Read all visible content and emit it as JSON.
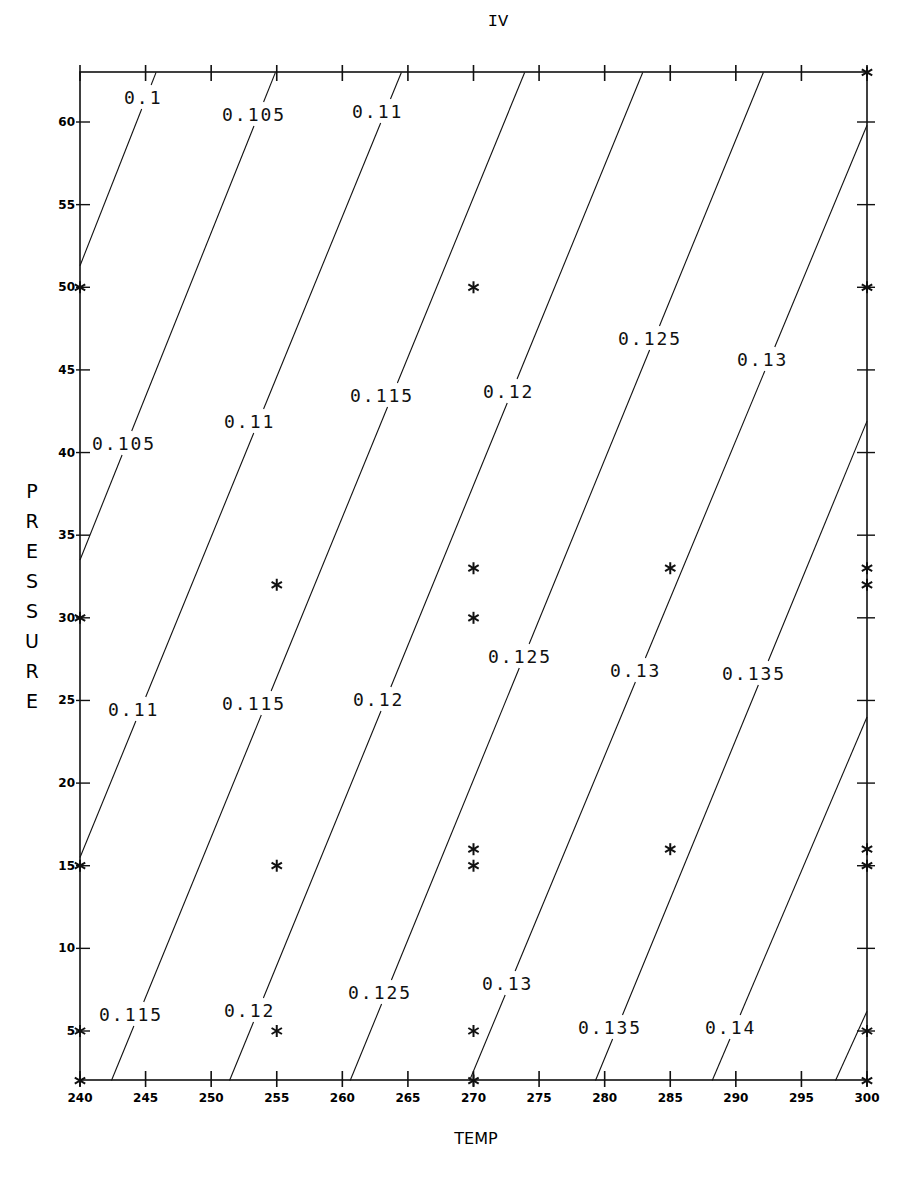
{
  "chart_data": {
    "type": "contour",
    "title": "IV",
    "xlabel": "TEMP",
    "ylabel": "PRESSURE",
    "xlim": [
      240,
      300
    ],
    "ylim": [
      2,
      63
    ],
    "grid": false,
    "x_ticks": [
      240,
      245,
      250,
      255,
      260,
      265,
      270,
      275,
      280,
      285,
      290,
      295,
      300
    ],
    "y_ticks": [
      5,
      10,
      15,
      20,
      25,
      30,
      35,
      40,
      45,
      50,
      55,
      60
    ],
    "contours": [
      {
        "level": "0.1",
        "p0": [
          240,
          51.3
        ],
        "p1": [
          245.8,
          63
        ]
      },
      {
        "level": "0.105",
        "p0": [
          240,
          33.5
        ],
        "p1": [
          254.9,
          63
        ]
      },
      {
        "level": "0.11",
        "p0": [
          240,
          15.5
        ],
        "p1": [
          264.5,
          63
        ]
      },
      {
        "level": "0.115",
        "p0": [
          242.4,
          2
        ],
        "p1": [
          273.9,
          63
        ]
      },
      {
        "level": "0.12",
        "p0": [
          251.4,
          2
        ],
        "p1": [
          282.9,
          63
        ]
      },
      {
        "level": "0.125",
        "p0": [
          260.6,
          2
        ],
        "p1": [
          292.1,
          63
        ]
      },
      {
        "level": "0.13",
        "p0": [
          269.7,
          2
        ],
        "p1": [
          300,
          59.8
        ]
      },
      {
        "level": "0.135",
        "p0": [
          279.3,
          2
        ],
        "p1": [
          300,
          41.9
        ]
      },
      {
        "level": "0.14",
        "p0": [
          288.2,
          2
        ],
        "p1": [
          300,
          24.0
        ]
      },
      {
        "level": "",
        "p0": [
          297.6,
          2
        ],
        "p1": [
          300,
          6.2
        ]
      }
    ],
    "contour_labels": [
      {
        "text": "0.1",
        "x": 124,
        "y": 104
      },
      {
        "text": "0.105",
        "x": 222,
        "y": 121
      },
      {
        "text": "0.11",
        "x": 352,
        "y": 118
      },
      {
        "text": "0.105",
        "x": 92,
        "y": 450
      },
      {
        "text": "0.11",
        "x": 224,
        "y": 428
      },
      {
        "text": "0.115",
        "x": 350,
        "y": 402
      },
      {
        "text": "0.12",
        "x": 483,
        "y": 398
      },
      {
        "text": "0.125",
        "x": 618,
        "y": 345
      },
      {
        "text": "0.13",
        "x": 737,
        "y": 366
      },
      {
        "text": "0.11",
        "x": 108,
        "y": 716
      },
      {
        "text": "0.115",
        "x": 222,
        "y": 710
      },
      {
        "text": "0.12",
        "x": 353,
        "y": 706
      },
      {
        "text": "0.125",
        "x": 488,
        "y": 663
      },
      {
        "text": "0.13",
        "x": 610,
        "y": 677
      },
      {
        "text": "0.135",
        "x": 722,
        "y": 680
      },
      {
        "text": "0.115",
        "x": 99,
        "y": 1021
      },
      {
        "text": "0.12",
        "x": 224,
        "y": 1017
      },
      {
        "text": "0.125",
        "x": 348,
        "y": 999
      },
      {
        "text": "0.13",
        "x": 482,
        "y": 990
      },
      {
        "text": "0.135",
        "x": 578,
        "y": 1034
      },
      {
        "text": "0.14",
        "x": 705,
        "y": 1034
      }
    ],
    "points": [
      [
        240,
        2
      ],
      [
        240,
        5
      ],
      [
        240,
        15
      ],
      [
        240,
        30
      ],
      [
        240,
        50
      ],
      [
        255,
        5
      ],
      [
        255,
        15
      ],
      [
        255,
        32
      ],
      [
        270,
        2
      ],
      [
        270,
        5
      ],
      [
        270,
        15
      ],
      [
        270,
        16
      ],
      [
        270,
        30
      ],
      [
        270,
        33
      ],
      [
        270,
        50
      ],
      [
        285,
        16
      ],
      [
        285,
        33
      ],
      [
        300,
        2
      ],
      [
        300,
        5
      ],
      [
        300,
        15
      ],
      [
        300,
        16
      ],
      [
        300,
        32
      ],
      [
        300,
        33
      ],
      [
        300,
        50
      ],
      [
        300,
        63
      ]
    ],
    "marker": "*"
  },
  "plot": {
    "title": "IV",
    "x_axis_title": "TEMP",
    "y_axis_title_letters": [
      "P",
      "R",
      "E",
      "S",
      "S",
      "U",
      "R",
      "E"
    ],
    "colors": {
      "ink": "#111111",
      "background": "#ffffff"
    }
  }
}
